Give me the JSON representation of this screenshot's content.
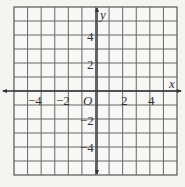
{
  "chart_data": {
    "type": "scatter",
    "title": "",
    "xlabel": "x",
    "ylabel": "y",
    "origin_label": "O",
    "xlim": [
      -6,
      6
    ],
    "ylim": [
      -6,
      6
    ],
    "grid": true,
    "grid_step": 1,
    "x_ticks": [
      "−4",
      "−2",
      "2",
      "4"
    ],
    "y_ticks": [
      "4",
      "2",
      "−2",
      "−4"
    ],
    "points": []
  }
}
